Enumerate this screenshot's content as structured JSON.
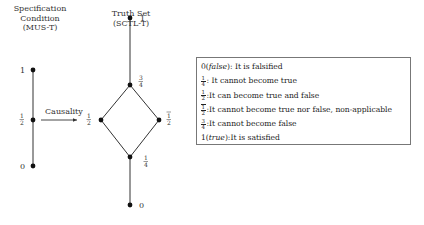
{
  "headers": {
    "left": [
      "Specification",
      "Condition",
      "(MUS-T)"
    ],
    "right": [
      "Truth Set",
      "(SCTL-T)"
    ]
  },
  "left_chain": {
    "nodes": [
      {
        "label": "1"
      },
      {
        "label_num": "1",
        "label_den": "2"
      },
      {
        "label": "0"
      }
    ]
  },
  "arrow_label": "Causality",
  "lattice": {
    "nodes": {
      "top": "1",
      "three_quarters": {
        "num": "3",
        "den": "4"
      },
      "left_half": {
        "num": "1",
        "den": "2"
      },
      "right_half": {
        "num": "1",
        "den": "2",
        "overline": true
      },
      "one_quarter": {
        "num": "1",
        "den": "4"
      },
      "bottom": "0"
    }
  },
  "legend": {
    "rows": [
      {
        "prefix": "0(",
        "italic": "false",
        "suffix": "): It is falsified"
      },
      {
        "num": "1",
        "den": "4",
        "text": ": It cannot become true"
      },
      {
        "num": "1",
        "den": "2",
        "text": ":It can become true and false"
      },
      {
        "num": "1",
        "den": "2",
        "overline": true,
        "text": ":It cannot become true nor false, non-applicable"
      },
      {
        "num": "3",
        "den": "4",
        "text": ":It cannot become false"
      },
      {
        "prefix": "1(",
        "italic": "true",
        "suffix": "):It is satisfied"
      }
    ]
  }
}
